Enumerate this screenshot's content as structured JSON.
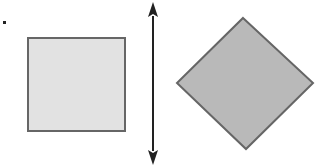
{
  "figure": {
    "marker_dot": {
      "x": 4,
      "y": 22,
      "size": 3,
      "color": "#222222"
    },
    "left_shape": {
      "type": "square",
      "x": 28,
      "y": 38,
      "width": 97,
      "height": 93,
      "fill": "#e2e2e2",
      "stroke": "#666666",
      "stroke_width": 2
    },
    "axis_arrow": {
      "type": "double-headed-vertical-arrow",
      "x": 153,
      "y1": 3,
      "y2": 164,
      "color": "#222222",
      "stroke_width": 2
    },
    "right_shape": {
      "type": "diamond",
      "points": "243,18 313,83 246,149 177,83",
      "fill": "#b9b9b9",
      "stroke": "#666666",
      "stroke_width": 2
    }
  }
}
